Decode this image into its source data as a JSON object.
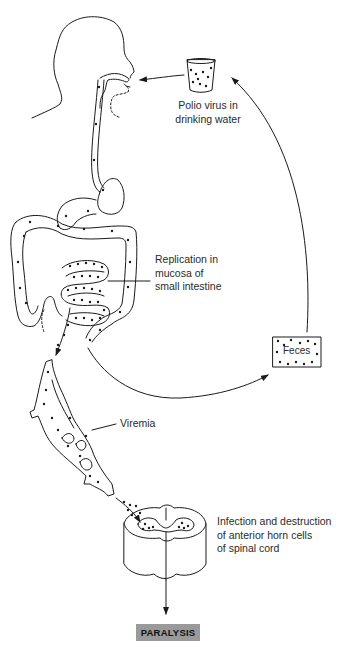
{
  "diagram": {
    "stages": [
      {
        "id": "water",
        "label_lines": [
          "Polio virus in",
          "drinking water"
        ]
      },
      {
        "id": "replication",
        "label_lines": [
          "Replication in",
          "mucosa of",
          "small intestine"
        ]
      },
      {
        "id": "feces",
        "label": "Feces"
      },
      {
        "id": "viremia",
        "label": "Viremia"
      },
      {
        "id": "spinal",
        "label_lines": [
          "Infection and destruction",
          "of anterior horn cells",
          "of spinal cord"
        ]
      },
      {
        "id": "outcome",
        "label": "PARALYSIS"
      }
    ],
    "flows": [
      {
        "from": "water",
        "to": "mouth"
      },
      {
        "from": "small intestine",
        "to": "bloodstream (viremia)"
      },
      {
        "from": "intestine",
        "to": "feces"
      },
      {
        "from": "feces",
        "to": "water"
      },
      {
        "from": "viremia",
        "to": "spinal cord"
      },
      {
        "from": "spinal cord",
        "to": "paralysis"
      }
    ],
    "colors": {
      "line": "#1a1a1a",
      "text": "#2a2a2a",
      "outcome_box": "#9a9a9a",
      "background": "#ffffff"
    }
  }
}
